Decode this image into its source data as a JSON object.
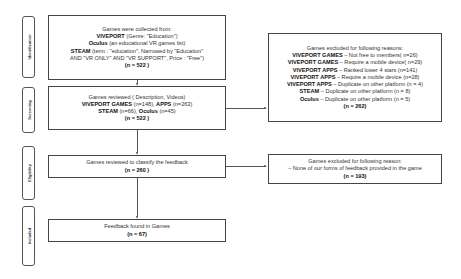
{
  "stages": {
    "identification": "Identification",
    "screening": "Screening",
    "eligibility": "Eligibility",
    "included": "Included"
  },
  "identification_box": {
    "line1": "Games were collected from:",
    "viveport_label": "VIVEPORT",
    "viveport_text": " (Genre: \"Education\")",
    "oculus_label": "Oculus",
    "oculus_text": " (an educational VR games list)",
    "steam_label": "STEAM",
    "steam_text": " (term : \"education\", Narrowed by \"Education\"",
    "steam_text2": "AND \"VR ONLY\" AND \"VR SUPPORT\", Price : \"Free\")",
    "count": "(n = 522 )"
  },
  "screening_box": {
    "line1": "Games reviewed ( Description, Videos)",
    "viveport_games_label": "VIVEPORT GAMES",
    "viveport_games_n": " (n=148), ",
    "apps_label": "APPS",
    "apps_n": " (n=263)",
    "steam_label": "STEAM",
    "steam_n": " (n=66), ",
    "oculus_label": "Oculus",
    "oculus_n": " (n=45)",
    "count": "(n = 522 )"
  },
  "eligibility_box": {
    "line1": "Games reviewed to classify the feedback",
    "count": "(n = 260 )"
  },
  "included_box": {
    "line1": "Feedback found in Games",
    "count": "(n = 67)"
  },
  "exclusion_box1": {
    "title": "Games excluded for following reasons:",
    "reasons": [
      {
        "label": "VIVEPORT GAMES",
        "text": " – Not free to members( n=26)"
      },
      {
        "label": "VIVEPORT GAMES",
        "text": " – Require a mobile device( n=29)"
      },
      {
        "label": "VIVEPORT APPS",
        "text": " – Ranked lower 4 stars (n=141)"
      },
      {
        "label": "VIVEPORT APPS",
        "text": " – Require a mobile device (n=28)"
      },
      {
        "label": "VIVEPORT APPS",
        "text": " – Duplicate on other platform (n = 4)"
      },
      {
        "label": "STEAM",
        "text": " – Duplicate on other platform (n = 8)"
      },
      {
        "label": "Oculus",
        "text": " – Duplicate on other platform (n = 5)"
      }
    ],
    "count": "(n = 262)"
  },
  "exclusion_box2": {
    "title": "Games excluded for following reason:",
    "reason": "– None of our forms of feedback provided in the game",
    "count": "(n = 193)"
  }
}
